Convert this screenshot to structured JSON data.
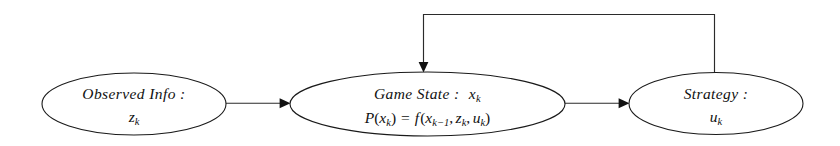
{
  "diagram": {
    "type": "flowchart",
    "background_color": "#ffffff",
    "line_color": "#2b2b2b",
    "text_color": "#111111",
    "nodes": [
      {
        "id": "observed-info",
        "shape": "ellipse",
        "line1": "Observed Info :",
        "line2_base": "z",
        "line2_sub": "k"
      },
      {
        "id": "game-state",
        "shape": "ellipse",
        "line1_label": "Game State :",
        "line1_var": "x",
        "line1_var_sub": "k",
        "line2_lhs_p": "P",
        "line2_lhs_open": "(",
        "line2_lhs_var": "x",
        "line2_lhs_sub": "k",
        "line2_lhs_close": ")",
        "line2_eq": "=",
        "line2_f": "f",
        "line2_open": "(",
        "line2_a_var": "x",
        "line2_a_sub": "k−1",
        "line2_comma1": ",",
        "line2_b_var": "z",
        "line2_b_sub": "k",
        "line2_comma2": ",",
        "line2_c_var": "u",
        "line2_c_sub": "k",
        "line2_close": ")"
      },
      {
        "id": "strategy",
        "shape": "ellipse",
        "line1": "Strategy :",
        "line2_base": "u",
        "line2_sub": "k"
      }
    ],
    "edges": [
      {
        "id": "observed-to-state",
        "from": "observed-info",
        "to": "game-state",
        "style": "solid-arrow",
        "direction": "right"
      },
      {
        "id": "state-to-strategy",
        "from": "game-state",
        "to": "strategy",
        "style": "solid-arrow",
        "direction": "right"
      },
      {
        "id": "strategy-feedback-to-state",
        "from": "strategy",
        "to": "game-state",
        "style": "solid-arrow-orthogonal",
        "direction": "up-left-down"
      }
    ]
  }
}
